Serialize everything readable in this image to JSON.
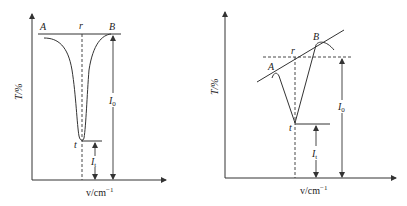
{
  "diagrams": [
    {
      "id": "left",
      "title": "",
      "y_axis_label": "T/%",
      "x_axis_label": "v/cm",
      "x_axis_exponent": "−1",
      "points": {
        "A": "A",
        "r": "r",
        "B": "B",
        "t": "t"
      },
      "intensity_labels": {
        "I0_main": "I",
        "I0_sub": "0",
        "It_main": "I",
        "It_sub": "t"
      },
      "baseline": "horizontal"
    },
    {
      "id": "right",
      "title": "",
      "y_axis_label": "T/%",
      "x_axis_label": "v/cm",
      "x_axis_exponent": "−1",
      "points": {
        "A": "A",
        "r": "r",
        "B": "B",
        "t": "t"
      },
      "intensity_labels": {
        "I0_main": "I",
        "I0_sub": "0",
        "It_main": "I",
        "It_sub": "t"
      },
      "baseline": "sloped tangent"
    }
  ],
  "colors": {
    "line": "#333333",
    "background": "#ffffff"
  }
}
